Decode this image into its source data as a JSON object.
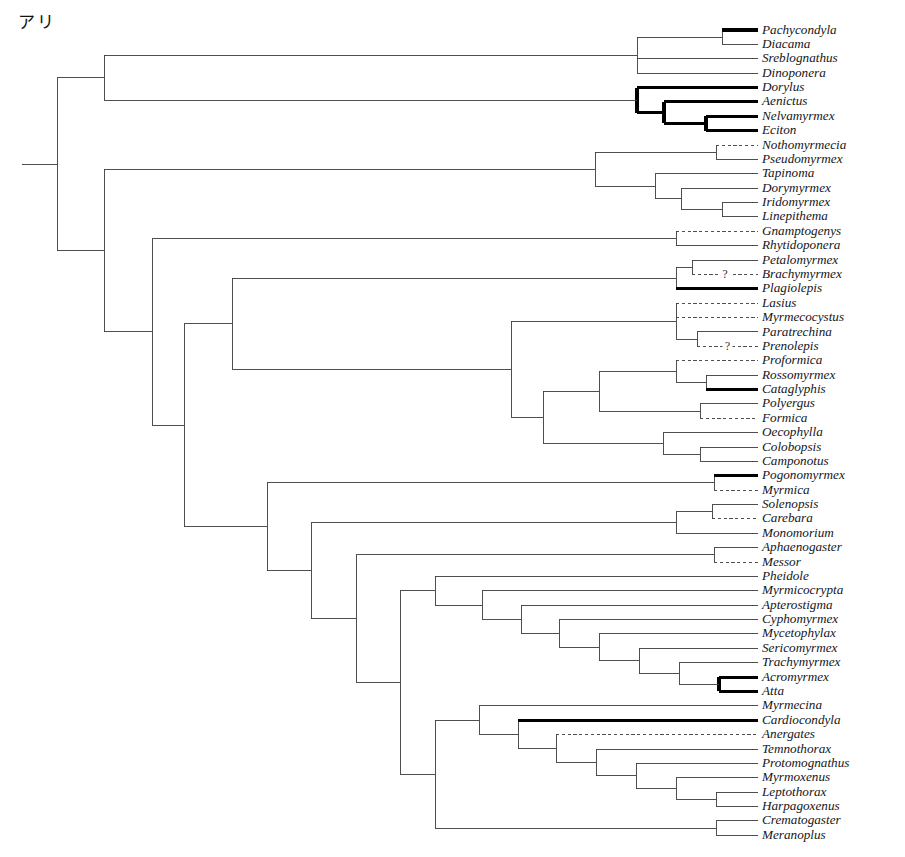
{
  "figure": {
    "corner_label": "アリ",
    "caption": "",
    "line_color": "#3c3c3c",
    "bold_color": "#000000",
    "background": "#ffffff"
  },
  "legend_styles": {
    "solid": "solid branch",
    "bold": "thick/bold branch",
    "dashed": "dashed/uncertain branch",
    "question": "?"
  },
  "chart_data": {
    "type": "tree",
    "tip_count": 57,
    "orientation": "left-to-right rectangular cladogram",
    "x_root": 22,
    "x_label": 762,
    "y_first": 30,
    "y_step": 14.38,
    "taxa": [
      {
        "name": "Pachycondyla",
        "style": "bold",
        "tip_x": 722
      },
      {
        "name": "Diacama",
        "style": "solid",
        "tip_x": 722
      },
      {
        "name": "Sreblognathus",
        "style": "solid",
        "tip_x": 637
      },
      {
        "name": "Dinoponera",
        "style": "solid",
        "tip_x": 637
      },
      {
        "name": "Dorylus",
        "style": "bold",
        "tip_x": 637
      },
      {
        "name": "Aenictus",
        "style": "bold",
        "tip_x": 664
      },
      {
        "name": "Nelvamyrmex",
        "style": "bold",
        "tip_x": 706
      },
      {
        "name": "Eciton",
        "style": "bold",
        "tip_x": 706
      },
      {
        "name": "Nothomyrmecia",
        "style": "dashed",
        "tip_x": 716
      },
      {
        "name": "Pseudomyrmex",
        "style": "solid",
        "tip_x": 716
      },
      {
        "name": "Tapinoma",
        "style": "solid",
        "tip_x": 655
      },
      {
        "name": "Dorymyrmex",
        "style": "solid",
        "tip_x": 681
      },
      {
        "name": "Iridomyrmex",
        "style": "solid",
        "tip_x": 722
      },
      {
        "name": "Linepithema",
        "style": "solid",
        "tip_x": 722
      },
      {
        "name": "Gnamptogenys",
        "style": "dashed",
        "tip_x": 676
      },
      {
        "name": "Rhytidoponera",
        "style": "solid",
        "tip_x": 676
      },
      {
        "name": "Petalomyrmex",
        "style": "solid",
        "tip_x": 692
      },
      {
        "name": "Brachymyrmex",
        "style": "dashed",
        "tip_x": 692,
        "question": true
      },
      {
        "name": "Plagiolepis",
        "style": "bold",
        "tip_x": 676
      },
      {
        "name": "Lasius",
        "style": "dashed",
        "tip_x": 676
      },
      {
        "name": "Myrmecocystus",
        "style": "dashed",
        "tip_x": 676
      },
      {
        "name": "Paratrechina",
        "style": "solid",
        "tip_x": 697
      },
      {
        "name": "Prenolepis",
        "style": "dashed",
        "tip_x": 697,
        "question": true
      },
      {
        "name": "Proformica",
        "style": "dashed",
        "tip_x": 676
      },
      {
        "name": "Rossomyrmex",
        "style": "solid",
        "tip_x": 706
      },
      {
        "name": "Cataglyphis",
        "style": "bold",
        "tip_x": 706
      },
      {
        "name": "Polyergus",
        "style": "solid",
        "tip_x": 700
      },
      {
        "name": "Formica",
        "style": "dashed",
        "tip_x": 700
      },
      {
        "name": "Oecophylla",
        "style": "solid",
        "tip_x": 663
      },
      {
        "name": "Colobopsis",
        "style": "solid",
        "tip_x": 700
      },
      {
        "name": "Camponotus",
        "style": "solid",
        "tip_x": 700
      },
      {
        "name": "Pogonomyrmex",
        "style": "bold",
        "tip_x": 714
      },
      {
        "name": "Myrmica",
        "style": "dashed",
        "tip_x": 714
      },
      {
        "name": "Solenopsis",
        "style": "solid",
        "tip_x": 712
      },
      {
        "name": "Carebara",
        "style": "dashed",
        "tip_x": 712
      },
      {
        "name": "Monomorium",
        "style": "solid",
        "tip_x": 676
      },
      {
        "name": "Aphaenogaster",
        "style": "solid",
        "tip_x": 714
      },
      {
        "name": "Messor",
        "style": "dashed",
        "tip_x": 714
      },
      {
        "name": "Pheidole",
        "style": "solid",
        "tip_x": 435
      },
      {
        "name": "Myrmicocrypta",
        "style": "solid",
        "tip_x": 482
      },
      {
        "name": "Apterostigma",
        "style": "solid",
        "tip_x": 521
      },
      {
        "name": "Cyphomyrmex",
        "style": "solid",
        "tip_x": 559
      },
      {
        "name": "Mycetophylax",
        "style": "solid",
        "tip_x": 599
      },
      {
        "name": "Sericomyrmex",
        "style": "solid",
        "tip_x": 639
      },
      {
        "name": "Trachymyrmex",
        "style": "solid",
        "tip_x": 679
      },
      {
        "name": "Acromyrmex",
        "style": "bold",
        "tip_x": 719
      },
      {
        "name": "Atta",
        "style": "bold",
        "tip_x": 719
      },
      {
        "name": "Myrmecina",
        "style": "solid",
        "tip_x": 479
      },
      {
        "name": "Cardiocondyla",
        "style": "bold",
        "tip_x": 518
      },
      {
        "name": "Anergates",
        "style": "dashed",
        "tip_x": 556
      },
      {
        "name": "Temnothorax",
        "style": "solid",
        "tip_x": 596
      },
      {
        "name": "Protomognathus",
        "style": "solid",
        "tip_x": 636
      },
      {
        "name": "Myrmoxenus",
        "style": "solid",
        "tip_x": 676
      },
      {
        "name": "Leptothorax",
        "style": "solid",
        "tip_x": 716
      },
      {
        "name": "Harpagoxenus",
        "style": "solid",
        "tip_x": 716
      },
      {
        "name": "Crematogaster",
        "style": "solid",
        "tip_x": 716
      },
      {
        "name": "Meranoplus",
        "style": "solid",
        "tip_x": 716
      }
    ],
    "clades": [
      {
        "id": "n_pachy_diac",
        "x": 722,
        "children_idx": [
          0,
          1
        ],
        "style": "solid",
        "up_style": "bold"
      },
      {
        "id": "n_ponerine",
        "x": 637,
        "children": [
          "n_pachy_diac"
        ],
        "children_idx": [
          2,
          3
        ],
        "style": "solid"
      },
      {
        "id": "n_nelv_ecit",
        "x": 706,
        "children_idx": [
          6,
          7
        ],
        "style": "bold"
      },
      {
        "id": "n_aen_nelv",
        "x": 664,
        "children_idx": [
          5
        ],
        "children": [
          "n_nelv_ecit"
        ],
        "style": "bold"
      },
      {
        "id": "n_dorylus",
        "x": 637,
        "children_idx": [
          4
        ],
        "children": [
          "n_aen_nelv"
        ],
        "style": "bold"
      },
      {
        "id": "n_poner_dory",
        "x": 104,
        "children": [
          "n_ponerine",
          "n_dorylus"
        ],
        "style": "solid"
      },
      {
        "id": "n_noth_pseud",
        "x": 716,
        "children_idx": [
          8,
          9
        ],
        "style": "solid"
      },
      {
        "id": "n_irido_line",
        "x": 722,
        "children_idx": [
          12,
          13
        ],
        "style": "solid"
      },
      {
        "id": "n_dory_irid",
        "x": 681,
        "children_idx": [
          11
        ],
        "children": [
          "n_irido_line"
        ],
        "style": "solid"
      },
      {
        "id": "n_dolicho",
        "x": 655,
        "children_idx": [
          10
        ],
        "children": [
          "n_dory_irid"
        ],
        "style": "solid"
      },
      {
        "id": "n_dol_pseud",
        "x": 595,
        "children": [
          "n_noth_pseud",
          "n_dolicho"
        ],
        "style": "solid"
      },
      {
        "id": "n_ectatom",
        "x": 676,
        "children_idx": [
          14,
          15
        ],
        "style": "solid"
      },
      {
        "id": "n_peta_brac",
        "x": 692,
        "children_idx": [
          16,
          17
        ],
        "style": "solid"
      },
      {
        "id": "n_plagio",
        "x": 676,
        "children": [
          "n_peta_brac"
        ],
        "children_idx": [
          18
        ],
        "style": "solid"
      },
      {
        "id": "n_para_pren",
        "x": 697,
        "children_idx": [
          21,
          22
        ],
        "style": "solid"
      },
      {
        "id": "n_lasius_gp",
        "x": 676,
        "children_idx": [
          19,
          20
        ],
        "children": [
          "n_para_pren"
        ],
        "style": "solid"
      },
      {
        "id": "n_ross_cata",
        "x": 706,
        "children_idx": [
          24,
          25
        ],
        "style": "solid"
      },
      {
        "id": "n_profo",
        "x": 676,
        "children_idx": [
          23
        ],
        "children": [
          "n_ross_cata"
        ],
        "style": "solid"
      },
      {
        "id": "n_poly_form",
        "x": 700,
        "children_idx": [
          26,
          27
        ],
        "style": "solid"
      },
      {
        "id": "n_formica_gp",
        "x": 599,
        "children": [
          "n_profo",
          "n_poly_form"
        ],
        "style": "solid"
      },
      {
        "id": "n_colo_camp",
        "x": 700,
        "children_idx": [
          29,
          30
        ],
        "style": "solid"
      },
      {
        "id": "n_campo_gp",
        "x": 663,
        "children_idx": [
          28
        ],
        "children": [
          "n_colo_camp"
        ],
        "style": "solid"
      },
      {
        "id": "n_formicinae",
        "x": 543,
        "children": [
          "n_formica_gp",
          "n_campo_gp"
        ],
        "style": "solid"
      },
      {
        "id": "n_form_lasi",
        "x": 511,
        "children": [
          "n_lasius_gp",
          "n_formicinae"
        ],
        "style": "solid"
      },
      {
        "id": "n_form_plag",
        "x": 232,
        "children": [
          "n_plagio",
          "n_form_lasi"
        ],
        "style": "solid"
      },
      {
        "id": "n_pogo_myrm",
        "x": 714,
        "children_idx": [
          31,
          32
        ],
        "style": "solid"
      },
      {
        "id": "n_sole_care",
        "x": 712,
        "children_idx": [
          33,
          34
        ],
        "style": "solid"
      },
      {
        "id": "n_solen_gp",
        "x": 676,
        "children": [
          "n_sole_care"
        ],
        "children_idx": [
          35
        ],
        "style": "solid"
      },
      {
        "id": "n_apha_mess",
        "x": 714,
        "children_idx": [
          36,
          37
        ],
        "style": "solid"
      },
      {
        "id": "n_acro_atta",
        "x": 719,
        "children_idx": [
          45,
          46
        ],
        "style": "bold"
      },
      {
        "id": "n_trachy",
        "x": 679,
        "children_idx": [
          44
        ],
        "children": [
          "n_acro_atta"
        ],
        "style": "solid"
      },
      {
        "id": "n_seri",
        "x": 639,
        "children_idx": [
          43
        ],
        "children": [
          "n_trachy"
        ],
        "style": "solid"
      },
      {
        "id": "n_myce",
        "x": 599,
        "children_idx": [
          42
        ],
        "children": [
          "n_seri"
        ],
        "style": "solid"
      },
      {
        "id": "n_cypho",
        "x": 559,
        "children_idx": [
          41
        ],
        "children": [
          "n_myce"
        ],
        "style": "solid"
      },
      {
        "id": "n_apter",
        "x": 521,
        "children_idx": [
          40
        ],
        "children": [
          "n_cypho"
        ],
        "style": "solid"
      },
      {
        "id": "n_attini",
        "x": 482,
        "children_idx": [
          39
        ],
        "children": [
          "n_apter"
        ],
        "style": "solid"
      },
      {
        "id": "n_pheid_att",
        "x": 435,
        "children_idx": [
          38
        ],
        "children": [
          "n_attini"
        ],
        "style": "solid"
      },
      {
        "id": "n_lept_harp",
        "x": 716,
        "children_idx": [
          53,
          54
        ],
        "style": "solid"
      },
      {
        "id": "n_myrmox",
        "x": 676,
        "children_idx": [
          52
        ],
        "children": [
          "n_lept_harp"
        ],
        "style": "solid"
      },
      {
        "id": "n_proto",
        "x": 636,
        "children_idx": [
          51
        ],
        "children": [
          "n_myrmox"
        ],
        "style": "solid"
      },
      {
        "id": "n_temno",
        "x": 596,
        "children_idx": [
          50
        ],
        "children": [
          "n_proto"
        ],
        "style": "solid"
      },
      {
        "id": "n_anerg",
        "x": 556,
        "children_idx": [
          49
        ],
        "children": [
          "n_temno"
        ],
        "style": "solid"
      },
      {
        "id": "n_cardio",
        "x": 518,
        "children_idx": [
          48
        ],
        "children": [
          "n_anerg"
        ],
        "style": "solid"
      },
      {
        "id": "n_myrmecina",
        "x": 479,
        "children_idx": [
          47
        ],
        "children": [
          "n_cardio"
        ],
        "style": "solid"
      },
      {
        "id": "n_crema_mera",
        "x": 716,
        "children_idx": [
          55,
          56
        ],
        "style": "solid"
      },
      {
        "id": "n_crema_clade",
        "x": 435,
        "children": [
          "n_myrmecina",
          "n_crema_mera"
        ],
        "style": "solid"
      },
      {
        "id": "n_lower_myrm",
        "x": 400,
        "children": [
          "n_pheid_att",
          "n_crema_clade"
        ],
        "style": "solid"
      },
      {
        "id": "n_myrm_apha",
        "x": 356,
        "children_idx": [],
        "children": [
          "n_apha_mess",
          "n_lower_myrm"
        ],
        "style": "solid"
      },
      {
        "id": "n_myrm_sole",
        "x": 311,
        "children": [
          "n_solen_gp",
          "n_myrm_apha"
        ],
        "style": "solid"
      },
      {
        "id": "n_myrmicinae",
        "x": 267,
        "children": [
          "n_pogo_myrm",
          "n_myrm_sole"
        ],
        "style": "solid"
      },
      {
        "id": "n_myrm_form",
        "x": 184,
        "children": [
          "n_form_plag",
          "n_myrmicinae"
        ],
        "style": "solid"
      },
      {
        "id": "n_ecta_rest",
        "x": 152,
        "children": [
          "n_ectatom",
          "n_myrm_form"
        ],
        "style": "solid"
      },
      {
        "id": "n_crown",
        "x": 104,
        "children": [
          "n_dol_pseud",
          "n_ecta_rest"
        ],
        "style": "solid"
      },
      {
        "id": "n_root",
        "x": 57,
        "children": [
          "n_poner_dory",
          "n_crown"
        ],
        "style": "solid"
      }
    ]
  }
}
